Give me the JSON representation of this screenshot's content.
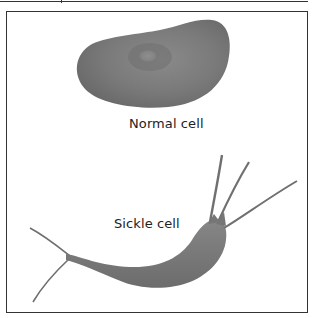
{
  "figure": {
    "cells": [
      {
        "id": "normal",
        "label": "Normal cell",
        "shape": "biconcave-disc",
        "color": "#7d7d7d"
      },
      {
        "id": "sickle",
        "label": "Sickle cell",
        "shape": "sickle-with-spikes",
        "color": "#7d7d7d"
      }
    ],
    "colors": {
      "cell_fill": "#7d7d7d",
      "cell_dark": "#5e5e5e",
      "frame": "#333333",
      "background": "#ffffff"
    }
  }
}
